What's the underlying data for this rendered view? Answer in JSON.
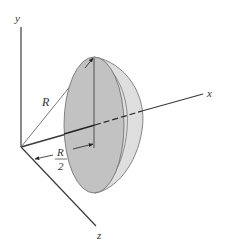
{
  "figure": {
    "axes": {
      "x_label": "x",
      "y_label": "y",
      "z_label": "z"
    },
    "annotations": {
      "radius_label": "R",
      "half_radius_numerator": "R",
      "half_radius_denominator": "2"
    },
    "colors": {
      "axis": "#3a3a3a",
      "disk_face": "#c2c2c2",
      "cap_side": "#dedede",
      "outline": "#6a6a6a",
      "background": "#ffffff"
    }
  }
}
